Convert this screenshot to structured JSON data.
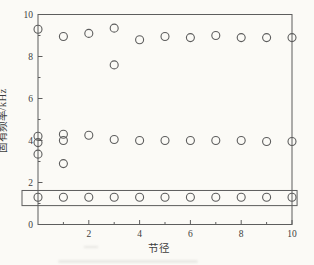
{
  "figure": {
    "background": "#fbfaf6",
    "line_color": "#5d5d5d",
    "text_color": "#3c3c3c"
  },
  "chart_data": {
    "type": "scatter",
    "title": "",
    "xlabel": "节径",
    "ylabel": "固有频率/kHz",
    "xlim": [
      0,
      10
    ],
    "ylim": [
      0,
      10
    ],
    "x_major_ticks": [
      2,
      4,
      6,
      8,
      10
    ],
    "x_minor_ticks": [
      1,
      3,
      5,
      7,
      9
    ],
    "y_major_ticks": [
      0,
      2,
      4,
      6,
      8,
      10
    ],
    "y_minor_ticks": [
      1,
      3,
      5,
      7,
      9
    ],
    "grid": false,
    "legend": "none",
    "marker": {
      "shape": "open-circle",
      "radius_px": 4,
      "stroke_px": 1.1
    },
    "series": [
      {
        "name": "upper-mode-family",
        "points": [
          [
            0,
            9.3
          ],
          [
            1,
            8.95
          ],
          [
            2,
            9.1
          ],
          [
            3,
            9.35
          ],
          [
            3,
            7.6
          ],
          [
            4,
            8.8
          ],
          [
            5,
            8.95
          ],
          [
            6,
            8.9
          ],
          [
            7,
            9.0
          ],
          [
            8,
            8.9
          ],
          [
            9,
            8.9
          ],
          [
            10,
            8.9
          ]
        ]
      },
      {
        "name": "middle-mode-family",
        "points": [
          [
            0,
            4.2
          ],
          [
            0,
            3.9
          ],
          [
            0,
            3.35
          ],
          [
            1,
            4.3
          ],
          [
            1,
            4.0
          ],
          [
            1,
            2.9
          ],
          [
            2,
            4.25
          ],
          [
            3,
            4.05
          ],
          [
            4,
            4.0
          ],
          [
            5,
            4.0
          ],
          [
            6,
            4.0
          ],
          [
            7,
            4.0
          ],
          [
            8,
            4.0
          ],
          [
            9,
            3.95
          ],
          [
            10,
            3.95
          ]
        ]
      },
      {
        "name": "lower-mode-family",
        "points": [
          [
            0,
            1.3
          ],
          [
            1,
            1.3
          ],
          [
            2,
            1.3
          ],
          [
            3,
            1.3
          ],
          [
            4,
            1.3
          ],
          [
            5,
            1.3
          ],
          [
            6,
            1.3
          ],
          [
            7,
            1.3
          ],
          [
            8,
            1.3
          ],
          [
            9,
            1.3
          ],
          [
            10,
            1.3
          ]
        ]
      }
    ],
    "highlight_box": {
      "x0": -0.63,
      "x1": 10.2,
      "y0": 0.9,
      "y1": 1.62
    }
  }
}
